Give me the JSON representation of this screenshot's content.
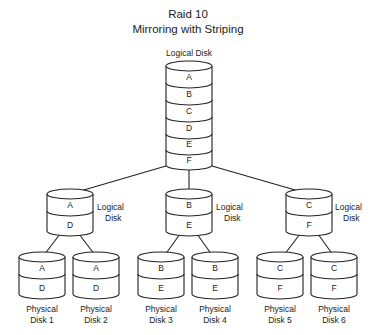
{
  "title": {
    "line1": "Raid 10",
    "line2": "Mirroring with Striping"
  },
  "top_disk": {
    "label": "Logical Disk",
    "segments": [
      "A",
      "B",
      "C",
      "D",
      "E",
      "F"
    ]
  },
  "mirror_groups": [
    {
      "logical": {
        "label_line1": "Logical",
        "label_line2": "Disk",
        "segments": [
          "A",
          "D"
        ]
      },
      "physical": [
        {
          "label_line1": "Physical",
          "label_line2": "Disk 1",
          "segments": [
            "A",
            "D"
          ]
        },
        {
          "label_line1": "Physical",
          "label_line2": "Disk 2",
          "segments": [
            "A",
            "D"
          ]
        }
      ]
    },
    {
      "logical": {
        "label_line1": "Logical",
        "label_line2": "Disk",
        "segments": [
          "B",
          "E"
        ]
      },
      "physical": [
        {
          "label_line1": "Physical",
          "label_line2": "Disk 3",
          "segments": [
            "B",
            "E"
          ]
        },
        {
          "label_line1": "Physical",
          "label_line2": "Disk 4",
          "segments": [
            "B",
            "E"
          ]
        }
      ]
    },
    {
      "logical": {
        "label_line1": "Logical",
        "label_line2": "Disk",
        "segments": [
          "C",
          "F"
        ]
      },
      "physical": [
        {
          "label_line1": "Physical",
          "label_line2": "Disk 5",
          "segments": [
            "C",
            "F"
          ]
        },
        {
          "label_line1": "Physical",
          "label_line2": "Disk 6",
          "segments": [
            "C",
            "F"
          ]
        }
      ]
    }
  ]
}
